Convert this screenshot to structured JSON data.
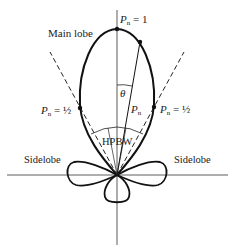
{
  "diagram": {
    "labels": {
      "main_lobe": "Main lobe",
      "peak": {
        "symbol": "P",
        "subscript": "n",
        "value": " = 1"
      },
      "half_power_left": {
        "symbol": "P",
        "subscript": "n",
        "value": " = ½"
      },
      "half_power_right": {
        "symbol": "P",
        "subscript": "n",
        "value": " = ½"
      },
      "theta": "θ",
      "radius": {
        "symbol": "P",
        "subscript": "n"
      },
      "hpbw": "HPBW",
      "sidelobe_left": "Sidelobe",
      "sidelobe_right": "Sidelobe"
    },
    "colors": {
      "line": "#111111",
      "text": "#222222",
      "background": "#ffffff"
    }
  }
}
